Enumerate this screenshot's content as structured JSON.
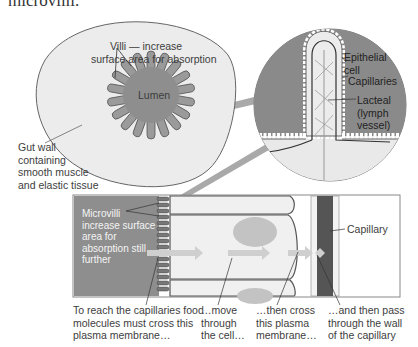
{
  "header": {
    "cut_title": "microvilli."
  },
  "gut_section": {
    "villi_label_line1": "Villi — increase",
    "villi_label_line2": "surface area for absorption",
    "lumen_label": "Lumen",
    "gut_wall_label": [
      "Gut wall",
      "containing",
      "smooth muscle",
      "and elastic tissue"
    ]
  },
  "villus_detail": {
    "epithelial_label": [
      "Epithelial",
      "cell"
    ],
    "capillaries_label": "Capillaries",
    "lacteal_label": [
      "Lacteal",
      "(lymph",
      "vessel)"
    ]
  },
  "cell_detail": {
    "microvilli_label": [
      "Microvilli",
      "increase surface",
      "area for",
      "absorption still",
      "further"
    ],
    "capillary_label": "Capillary"
  },
  "captions": [
    {
      "lines": [
        "To reach the capillaries food",
        "molecules must cross this",
        "plasma membrane…"
      ]
    },
    {
      "lines": [
        "…move",
        "through",
        "the cell…"
      ]
    },
    {
      "lines": [
        "…then cross",
        "this plasma",
        "membrane…"
      ]
    },
    {
      "lines": [
        "…and then pass",
        "through the wall",
        "of the capillary"
      ]
    }
  ],
  "colors": {
    "gut_wall_fill": "#e9e9e9",
    "lumen_fill": "#8e8e8e",
    "villus_bg": "#8a8a8a",
    "cell_fill": "#f0f0f0",
    "capillary_fill": "#5a5a5a",
    "arrow": "#c8c8c8",
    "outline": "#555555"
  }
}
